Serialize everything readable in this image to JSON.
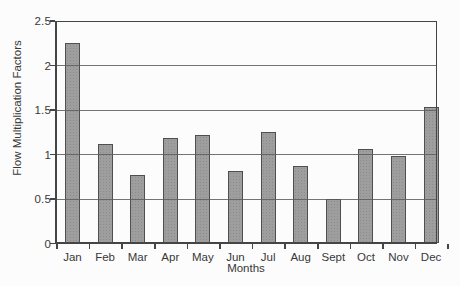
{
  "chart_data": {
    "type": "bar",
    "categories": [
      "Jan",
      "Feb",
      "Mar",
      "Apr",
      "May",
      "Jun",
      "Jul",
      "Aug",
      "Sept",
      "Oct",
      "Nov",
      "Dec"
    ],
    "values": [
      2.25,
      1.12,
      0.77,
      1.18,
      1.22,
      0.82,
      1.25,
      0.87,
      0.5,
      1.06,
      0.98,
      1.53
    ],
    "xlabel": "Months",
    "ylabel": "Flow Multiplication Factors",
    "ylim": [
      0,
      2.5
    ],
    "ytick_values": [
      0,
      0.5,
      1,
      1.5,
      2,
      2.5
    ],
    "ytick_labels": [
      "0",
      "0.5",
      "1",
      "1.5",
      "2",
      "2.5"
    ],
    "grid": true,
    "legend": false,
    "gridlines_over_bars": true
  },
  "colors": {
    "bar_fill": "#9e9e9e",
    "bar_border": "#4f4f4f",
    "gridline": "#5c5c5c",
    "frame": "#454545",
    "text": "#383838",
    "background": "#fcfcfc"
  }
}
